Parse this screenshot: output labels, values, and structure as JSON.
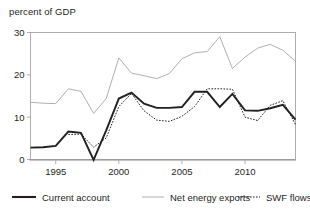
{
  "figure": {
    "axis_title": "percent of GDP",
    "background": "#ffffff",
    "frame_color": "#9a9a9a"
  },
  "legend": {
    "position": "bottom",
    "items": [
      {
        "label": "Current account",
        "style": "solid-thick",
        "color": "#231f20"
      },
      {
        "label": "Net energy exports",
        "style": "solid-thin",
        "color": "#b0b0b0"
      },
      {
        "label": "SWF flows",
        "style": "dotted",
        "color": "#231f20"
      }
    ]
  },
  "chart_data": {
    "type": "line",
    "title": "",
    "subtitle": "",
    "xlabel": "",
    "ylabel": "percent of GDP",
    "xlim": [
      1993,
      2014
    ],
    "ylim": [
      0,
      30
    ],
    "grid": false,
    "yticks": [
      0,
      10,
      20,
      30
    ],
    "ytick_labels": [
      "0",
      "10",
      "20",
      "30"
    ],
    "xticks": [
      1995,
      2000,
      2005,
      2010
    ],
    "xtick_labels": [
      "1995",
      "2000",
      "2005",
      "2010"
    ],
    "x": [
      1993,
      1994,
      1995,
      1996,
      1997,
      1998,
      1999,
      2000,
      2001,
      2002,
      2003,
      2004,
      2005,
      2006,
      2007,
      2008,
      2009,
      2010,
      2011,
      2012,
      2013,
      2014
    ],
    "series": [
      {
        "name": "Current account",
        "color": "#231f20",
        "style": "solid-thick",
        "values": [
          2.8,
          2.9,
          3.2,
          6.6,
          6.3,
          -0.1,
          6.9,
          14.4,
          15.8,
          13.2,
          12.2,
          12.2,
          12.4,
          16.0,
          16.0,
          12.4,
          15.5,
          11.6,
          11.5,
          12.1,
          12.9,
          9.4
        ]
      },
      {
        "name": "Net energy exports",
        "color": "#b0b0b0",
        "style": "solid-thin",
        "values": [
          13.5,
          13.3,
          13.2,
          16.7,
          16.1,
          10.9,
          14.4,
          24.0,
          20.4,
          19.8,
          19.1,
          20.3,
          23.8,
          25.2,
          25.5,
          29.0,
          21.5,
          24.2,
          26.3,
          27.2,
          25.8,
          23.2
        ]
      },
      {
        "name": "SWF flows",
        "color": "#231f20",
        "style": "dotted",
        "values": [
          null,
          null,
          null,
          5.9,
          6.0,
          2.9,
          5.1,
          12.5,
          15.6,
          11.5,
          9.3,
          9.0,
          10.2,
          12.5,
          16.7,
          16.7,
          16.6,
          10.0,
          9.2,
          12.8,
          13.9,
          8.3
        ]
      }
    ]
  }
}
